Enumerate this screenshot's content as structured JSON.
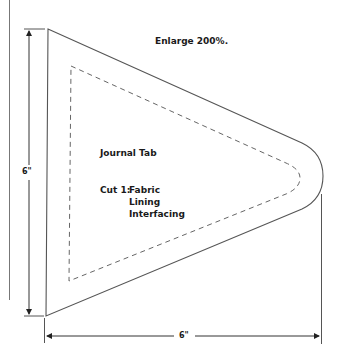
{
  "pattern": {
    "instruction": "Enlarge 200%.",
    "title": "Journal Tab",
    "cut_label": "Cut 1:",
    "materials": [
      "Fabric",
      "Lining",
      "Interfacing"
    ]
  },
  "dimensions": {
    "height": "6\"",
    "width": "6\""
  },
  "colors": {
    "line": "#555555",
    "text": "#1a1a1a",
    "background": "#ffffff"
  }
}
